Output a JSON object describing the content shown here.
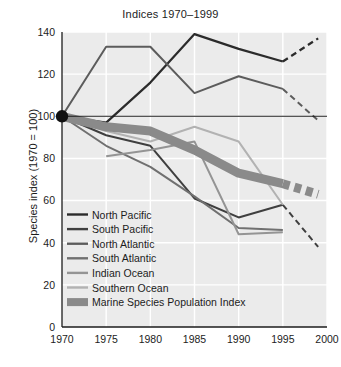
{
  "chart_data": {
    "type": "line",
    "title": "Indices 1970–1999",
    "xlabel": "",
    "ylabel": "Species index (1970 = 100)",
    "xlim": [
      1970,
      2000
    ],
    "ylim": [
      0,
      140
    ],
    "x_ticks": [
      "1970",
      "1975",
      "1980",
      "1985",
      "1990",
      "1995",
      "2000"
    ],
    "y_ticks": [
      "0",
      "20",
      "40",
      "60",
      "80",
      "100",
      "120",
      "140"
    ],
    "grid": true,
    "legend_position": "lower-left-inside",
    "reference_line": {
      "value": 100,
      "label": "1970 = 100 baseline"
    },
    "origin_marker": {
      "x": 1970,
      "y": 100,
      "style": "filled-circle"
    },
    "series": [
      {
        "name": "North Pacific",
        "color": "#2b2b2b",
        "width": 2.2,
        "x": [
          1970,
          1975,
          1980,
          1985,
          1990,
          1995
        ],
        "values": [
          100,
          97,
          116,
          139,
          132,
          126
        ],
        "projection_x": [
          1995,
          1999
        ],
        "projection_values": [
          126,
          137
        ],
        "projection_style": "dashed"
      },
      {
        "name": "South Pacific",
        "color": "#3f3f3f",
        "width": 2.0,
        "x": [
          1970,
          1975,
          1980,
          1985,
          1990,
          1995
        ],
        "values": [
          100,
          91,
          86,
          61,
          52,
          58
        ],
        "projection_x": [
          1995,
          1999
        ],
        "projection_values": [
          58,
          38
        ],
        "projection_style": "dashed"
      },
      {
        "name": "North Atlantic",
        "color": "#5c5c5c",
        "width": 2.0,
        "x": [
          1970,
          1975,
          1980,
          1985,
          1990,
          1995
        ],
        "values": [
          100,
          133,
          133,
          111,
          119,
          113
        ],
        "projection_x": [
          1995,
          1999
        ],
        "projection_values": [
          113,
          98
        ],
        "projection_style": "dashed"
      },
      {
        "name": "South Atlantic",
        "color": "#707070",
        "width": 2.0,
        "x": [
          1970,
          1975,
          1980,
          1985,
          1990,
          1995
        ],
        "values": [
          100,
          86,
          76,
          62,
          47,
          46
        ],
        "projection_x": [],
        "projection_values": [],
        "projection_style": "none"
      },
      {
        "name": "Indian Ocean",
        "color": "#949494",
        "width": 2.0,
        "x": [
          1975,
          1980,
          1985,
          1990,
          1995
        ],
        "values": [
          81,
          84,
          88,
          44,
          45
        ],
        "projection_x": [],
        "projection_values": [],
        "projection_style": "none"
      },
      {
        "name": "Southern Ocean",
        "color": "#b2b2b2",
        "width": 2.0,
        "x": [
          1970,
          1975,
          1980,
          1985,
          1990,
          1995
        ],
        "values": [
          100,
          93,
          88,
          95,
          88,
          58
        ],
        "projection_x": [],
        "projection_values": [],
        "projection_style": "none"
      },
      {
        "name": "Marine Species Population Index",
        "color": "#8a8a8a",
        "width": 9,
        "style": "thick-band",
        "x": [
          1970,
          1975,
          1980,
          1985,
          1990,
          1995
        ],
        "values": [
          100,
          95,
          93,
          84,
          73,
          68
        ],
        "projection_x": [
          1995,
          1999
        ],
        "projection_values": [
          68,
          63
        ],
        "projection_style": "dashed-blocks"
      }
    ]
  },
  "legend": {
    "items": [
      {
        "label": "North Pacific"
      },
      {
        "label": "South Pacific"
      },
      {
        "label": "North Atlantic"
      },
      {
        "label": "South Atlantic"
      },
      {
        "label": "Indian Ocean"
      },
      {
        "label": "Southern Ocean"
      },
      {
        "label": "Marine Species Population Index"
      }
    ]
  },
  "colors": {
    "plot_background": "#ebebeb",
    "figure_background": "#ffffff",
    "gridline": "#ffffff",
    "axis": "#1c1c1c",
    "text": "#1c1c1c"
  }
}
